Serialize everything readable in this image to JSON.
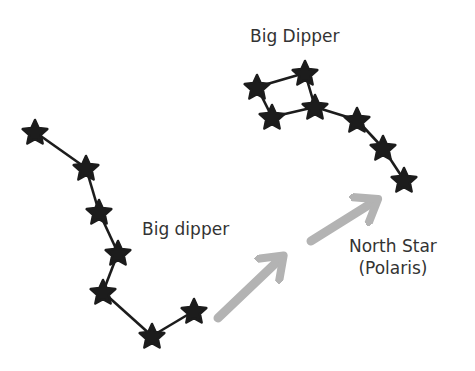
{
  "labels": {
    "big_dipper_top": "Big Dipper",
    "big_dipper_left": "Big dipper",
    "north_star_line1": "North Star",
    "north_star_line2": "(Polaris)"
  },
  "colors": {
    "star": "#1c1c1c",
    "line": "#1c1c1c",
    "arrow": "#b3b3b3",
    "text": "#333333",
    "background": "#ffffff"
  },
  "constellations": [
    {
      "name": "big-dipper-top",
      "stars": [
        [
          257,
          87
        ],
        [
          305,
          73
        ],
        [
          272,
          117
        ],
        [
          315,
          107
        ],
        [
          357,
          120
        ],
        [
          383,
          148
        ],
        [
          404,
          180
        ]
      ],
      "edges": [
        [
          0,
          1
        ],
        [
          1,
          3
        ],
        [
          3,
          2
        ],
        [
          2,
          0
        ],
        [
          3,
          4
        ],
        [
          4,
          5
        ],
        [
          5,
          6
        ]
      ]
    },
    {
      "name": "big-dipper-left",
      "stars": [
        [
          35,
          132
        ],
        [
          86,
          168
        ],
        [
          99,
          212
        ],
        [
          118,
          253
        ],
        [
          103,
          292
        ],
        [
          152,
          336
        ],
        [
          194,
          311
        ]
      ],
      "edges": [
        [
          0,
          1
        ],
        [
          1,
          2
        ],
        [
          2,
          3
        ],
        [
          3,
          4
        ],
        [
          4,
          5
        ],
        [
          5,
          6
        ]
      ]
    }
  ],
  "arrows": [
    {
      "from": [
        218,
        318
      ],
      "to": [
        281,
        258
      ]
    },
    {
      "from": [
        311,
        241
      ],
      "to": [
        375,
        201
      ]
    }
  ]
}
